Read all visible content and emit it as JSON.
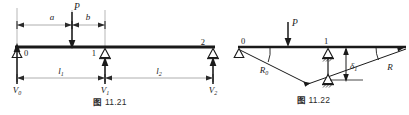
{
  "sheet": {
    "title": "Beam diagrams 11.21 and 11.22",
    "background": "#ffffff",
    "ink": "#1a1a1a",
    "dim_line_color": "#8a8a8a"
  },
  "figure1": {
    "caption_prefix": "图",
    "caption_number": "11.21",
    "caption": "图 11.21",
    "nodes": [
      {
        "id": "0",
        "label": "0"
      },
      {
        "id": "1",
        "label": "1"
      },
      {
        "id": "2",
        "label": "2"
      }
    ],
    "load": {
      "label": "P",
      "type": "point-load",
      "direction": "down"
    },
    "dimensions": [
      {
        "label": "a",
        "from": "0",
        "to": "P"
      },
      {
        "label": "b",
        "from": "P",
        "to": "1"
      },
      {
        "label": "l",
        "sub": "1",
        "text": "l₁",
        "from": "0",
        "to": "1"
      },
      {
        "label": "l",
        "sub": "2",
        "text": "l₂",
        "from": "1",
        "to": "2"
      }
    ],
    "reactions": [
      {
        "label": "V",
        "sub": "0",
        "text": "V₀",
        "at": "0",
        "direction": "up"
      },
      {
        "label": "V",
        "sub": "1",
        "text": "V₁",
        "at": "1",
        "direction": "up"
      },
      {
        "label": "V",
        "sub": "2",
        "text": "V₂",
        "at": "2",
        "direction": "up"
      }
    ],
    "supports": [
      {
        "at": "0",
        "type": "pin-triangle"
      },
      {
        "at": "1",
        "type": "pin-triangle"
      },
      {
        "at": "2",
        "type": "pin-triangle"
      }
    ]
  },
  "figure2": {
    "caption_prefix": "图",
    "caption_number": "11.22",
    "caption": "图 11.22",
    "nodes": [
      {
        "id": "0",
        "label": "0"
      },
      {
        "id": "1",
        "label": "1"
      }
    ],
    "load": {
      "label": "P",
      "type": "point-load",
      "direction": "down"
    },
    "rotations": [
      {
        "label": "R",
        "sub": "0",
        "text": "R₀",
        "at": "0"
      },
      {
        "label": "R",
        "sub": "",
        "text": "R",
        "at": "right-end"
      }
    ],
    "displacement": {
      "label": "δ",
      "sub": "1",
      "text": "δ₁",
      "at": "1",
      "direction": "down"
    },
    "supports": [
      {
        "at": "0",
        "type": "pin-triangle"
      },
      {
        "at": "1",
        "type": "pin-triangle-hatched"
      },
      {
        "at": "1-displaced",
        "type": "pin-triangle-hatched"
      }
    ]
  }
}
